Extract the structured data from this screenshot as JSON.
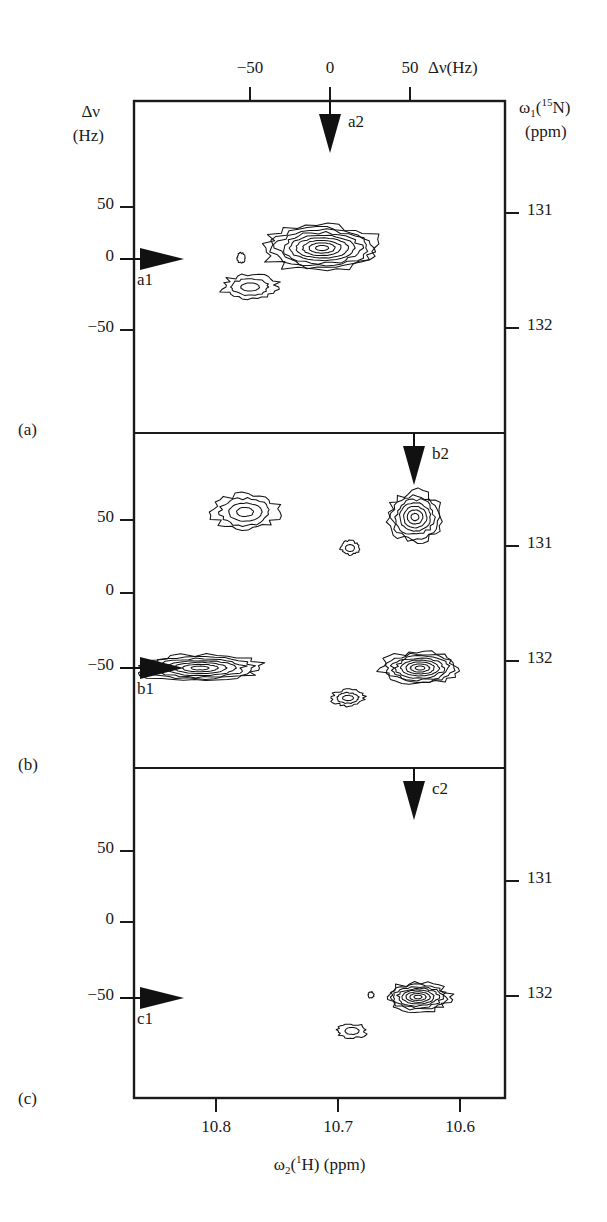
{
  "figure": {
    "type": "nmr-2d-contour-spectrum",
    "panels_count": 3
  },
  "axes": {
    "top": {
      "title_main": "Δν(Hz)",
      "ticks": [
        {
          "label": "−50",
          "value": -50,
          "x": 250
        },
        {
          "label": "0",
          "value": 0,
          "x": 330
        },
        {
          "label": "50",
          "value": 50,
          "x": 410
        }
      ]
    },
    "left": {
      "title_line1": "Δν",
      "title_line2": "(Hz)",
      "ticks": [
        "50",
        "0",
        "−50"
      ]
    },
    "right": {
      "title_line1_pre": "ω",
      "title_line1_sub": "1",
      "title_line1_mid": "(",
      "title_line1_sup": "15",
      "title_line1_post": "N)",
      "title_line2": "(ppm)",
      "ticks": [
        "131",
        "132"
      ]
    },
    "bottom": {
      "title_pre": "ω",
      "title_sub": "2",
      "title_mid": "(",
      "title_sup": "1",
      "title_post": "H) (ppm)",
      "ticks": [
        {
          "label": "10.8",
          "value": 10.8,
          "x": 216
        },
        {
          "label": "10.7",
          "value": 10.7,
          "x": 338
        },
        {
          "label": "10.6",
          "value": 10.6,
          "x": 460
        }
      ]
    }
  },
  "panels": [
    {
      "id": "a",
      "label": "(a)",
      "left_ticks": [
        {
          "label": "50",
          "value": 50,
          "y": 207
        },
        {
          "label": "0",
          "value": 0,
          "y": 259
        },
        {
          "label": "−50",
          "value": -50,
          "y": 330
        }
      ],
      "right_ticks": [
        {
          "label": "131",
          "value": 131,
          "y": 213
        },
        {
          "label": "132",
          "value": 132,
          "y": 328
        }
      ],
      "markers": [
        {
          "name": "a1",
          "label": "a1",
          "direction": "right",
          "axis": "left",
          "y": 259
        },
        {
          "name": "a2",
          "label": "a2",
          "direction": "down",
          "axis": "top",
          "x": 330
        }
      ],
      "peaks": [
        {
          "name": "main-crosspeak-a",
          "cx": 322,
          "cy": 248,
          "rings": 9,
          "rx": 58,
          "ry": 23,
          "intensity": "strong"
        },
        {
          "name": "satellite-peak-a-lower-left",
          "cx": 250,
          "cy": 287,
          "rings": 3,
          "rx": 28,
          "ry": 12,
          "intensity": "weak"
        },
        {
          "name": "small-peak-a-left",
          "cx": 241,
          "cy": 258,
          "rings": 1,
          "rx": 4,
          "ry": 5,
          "intensity": "trace"
        }
      ]
    },
    {
      "id": "b",
      "label": "(b)",
      "left_ticks": [
        {
          "label": "50",
          "value": 50,
          "y": 520
        },
        {
          "label": "0",
          "value": 0,
          "y": 593
        },
        {
          "label": "−50",
          "value": -50,
          "y": 668
        }
      ],
      "right_ticks": [
        {
          "label": "131",
          "value": 131,
          "y": 546
        },
        {
          "label": "132",
          "value": 132,
          "y": 661
        }
      ],
      "markers": [
        {
          "name": "b1",
          "label": "b1",
          "direction": "right",
          "axis": "left",
          "y": 668
        },
        {
          "name": "b2",
          "label": "b2",
          "direction": "down",
          "axis": "top",
          "x": 414
        }
      ],
      "peaks": [
        {
          "name": "peak-b-upper-left",
          "cx": 245,
          "cy": 512,
          "rings": 4,
          "rx": 33,
          "ry": 18,
          "intensity": "medium"
        },
        {
          "name": "peak-b-upper-right",
          "cx": 415,
          "cy": 517,
          "rings": 7,
          "rx": 27,
          "ry": 25,
          "intensity": "strong"
        },
        {
          "name": "peak-b-center-small",
          "cx": 350,
          "cy": 548,
          "rings": 2,
          "rx": 9,
          "ry": 7,
          "intensity": "weak"
        },
        {
          "name": "peak-b-lower-left",
          "cx": 200,
          "cy": 668,
          "rings": 7,
          "rx": 62,
          "ry": 13,
          "intensity": "strong"
        },
        {
          "name": "peak-b-lower-right",
          "cx": 420,
          "cy": 668,
          "rings": 8,
          "rx": 38,
          "ry": 16,
          "intensity": "strong"
        },
        {
          "name": "peak-b-lower-center-small",
          "cx": 348,
          "cy": 698,
          "rings": 3,
          "rx": 16,
          "ry": 8,
          "intensity": "weak"
        }
      ]
    },
    {
      "id": "c",
      "label": "(c)",
      "left_ticks": [
        {
          "label": "50",
          "value": 50,
          "y": 851
        },
        {
          "label": "0",
          "value": 0,
          "y": 922
        },
        {
          "label": "−50",
          "value": -50,
          "y": 998
        }
      ],
      "right_ticks": [
        {
          "label": "131",
          "value": 131,
          "y": 881
        },
        {
          "label": "132",
          "value": 132,
          "y": 996
        }
      ],
      "markers": [
        {
          "name": "c1",
          "label": "c1",
          "direction": "right",
          "axis": "left",
          "y": 998
        },
        {
          "name": "c2",
          "label": "c2",
          "direction": "down",
          "axis": "top",
          "x": 414
        }
      ],
      "peaks": [
        {
          "name": "main-crosspeak-c",
          "cx": 418,
          "cy": 997,
          "rings": 8,
          "rx": 32,
          "ry": 14,
          "intensity": "strong"
        },
        {
          "name": "small-peak-c-lower-left",
          "cx": 352,
          "cy": 1031,
          "rings": 2,
          "rx": 14,
          "ry": 7,
          "intensity": "weak"
        },
        {
          "name": "trace-peak-c-left",
          "cx": 371,
          "cy": 995,
          "rings": 1,
          "rx": 3,
          "ry": 3,
          "intensity": "trace"
        }
      ]
    }
  ],
  "geometry": {
    "plot_left": 134,
    "plot_right": 505,
    "plot_top": 101,
    "plot_bottom": 1098,
    "divider_ab": 433,
    "divider_bc": 768
  },
  "colors": {
    "ink": "#1a1a1a",
    "contour": "#111111",
    "background": "#ffffff"
  }
}
